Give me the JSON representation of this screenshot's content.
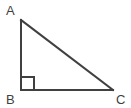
{
  "figure": {
    "type": "right-triangle-diagram",
    "canvas": {
      "width": 131,
      "height": 108,
      "background": "#ffffff"
    },
    "style": {
      "stroke_color": "#404040",
      "stroke_width": 2,
      "label_color": "#3f3f3f",
      "label_font_size": 13
    },
    "vertices": [
      {
        "name": "A",
        "label": "A",
        "x": 21,
        "y": 20,
        "label_x": 6,
        "label_y": 15
      },
      {
        "name": "B",
        "label": "B",
        "x": 21,
        "y": 90,
        "label_x": 6,
        "label_y": 104
      },
      {
        "name": "C",
        "label": "C",
        "x": 113,
        "y": 90,
        "label_x": 116,
        "label_y": 104
      }
    ],
    "sides": [
      {
        "name": "AB",
        "from": "A",
        "to": "B",
        "x1": 21,
        "y1": 20,
        "x2": 21,
        "y2": 90
      },
      {
        "name": "BC",
        "from": "B",
        "to": "C",
        "x1": 21,
        "y1": 90,
        "x2": 113,
        "y2": 90
      },
      {
        "name": "CA",
        "from": "C",
        "to": "A",
        "x1": 113,
        "y1": 90,
        "x2": 21,
        "y2": 20
      }
    ],
    "right_angle_marker": {
      "at_vertex": "B",
      "size": 13,
      "points": "34,90 34,77 21,77"
    }
  }
}
